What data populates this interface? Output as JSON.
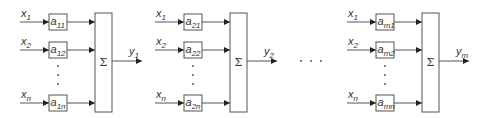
{
  "diagram": {
    "colors": {
      "line": "#555555",
      "arrow": "#222222",
      "text": "#333333",
      "background": "#ffffff"
    },
    "rows": [
      {
        "input": "x",
        "input_sub": "1",
        "y": 22
      },
      {
        "input": "x",
        "input_sub": "2",
        "y": 50
      },
      {
        "input": "x",
        "input_sub": "n",
        "y": 103
      }
    ],
    "blocks": [
      {
        "offset": 0,
        "weights": [
          {
            "base": "a",
            "sub": "11"
          },
          {
            "base": "a",
            "sub": "12"
          },
          {
            "base": "a",
            "sub": "1n"
          }
        ],
        "sum_symbol": "Σ",
        "output": {
          "base": "y",
          "sub": "1"
        }
      },
      {
        "offset": 135,
        "weights": [
          {
            "base": "a",
            "sub": "21"
          },
          {
            "base": "a",
            "sub": "22"
          },
          {
            "base": "a",
            "sub": "2n"
          }
        ],
        "sum_symbol": "Σ",
        "output": {
          "base": "y",
          "sub": "2"
        }
      },
      {
        "offset": 327,
        "weights": [
          {
            "base": "a",
            "sub": "m1"
          },
          {
            "base": "a",
            "sub": "m2"
          },
          {
            "base": "a",
            "sub": "mn"
          }
        ],
        "sum_symbol": "Σ",
        "output": {
          "base": "y",
          "sub": "m"
        }
      }
    ],
    "ellipsis": "· · ·"
  }
}
